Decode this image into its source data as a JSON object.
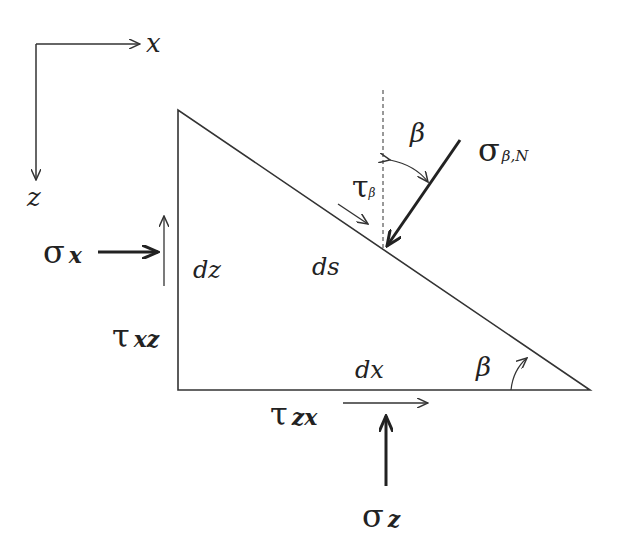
{
  "axes": {
    "x_label": "x",
    "z_label": "z"
  },
  "element": {
    "dz_label": "dz",
    "ds_label": "ds",
    "dx_label": "dx",
    "angle_label": "β"
  },
  "stresses": {
    "sigma_x": {
      "symbol": "σ",
      "sub": "x"
    },
    "tau_xz": {
      "symbol": "τ",
      "sub": "xz"
    },
    "tau_zx": {
      "symbol": "τ",
      "sub": "zx"
    },
    "sigma_z": {
      "symbol": "σ",
      "sub": "z"
    },
    "sigma_beta_n": {
      "symbol": "σ",
      "sub": "β,N"
    },
    "tau_beta": {
      "symbol": "τ",
      "sub": "β"
    },
    "beta_top": "β"
  },
  "colors": {
    "line": "#333333"
  }
}
